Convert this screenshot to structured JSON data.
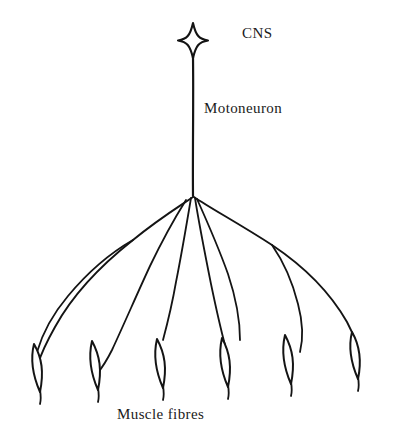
{
  "figure": {
    "background_color": "#ffffff",
    "ink_color": "#141414"
  },
  "labels": {
    "cns": "CNS",
    "motoneuron": "Motoneuron",
    "muscle_fibres": "Muscle fibres"
  },
  "structures": {
    "soma": {
      "name": "Cell body (star shaped)",
      "center_x": 193,
      "center_y": 40
    },
    "axon": {
      "name": "Axon",
      "top_y": 58,
      "branch_point_x": 193,
      "branch_point_y": 196
    },
    "branch_nodes": [
      {
        "name": "left-secondary-node",
        "x": 133,
        "y": 240
      },
      {
        "name": "right-secondary-node",
        "x": 272,
        "y": 245
      }
    ],
    "muscle_fibre_count": 6,
    "muscle_fibres": [
      {
        "index": 1,
        "x": 37,
        "y": 370
      },
      {
        "index": 2,
        "x": 95,
        "y": 368
      },
      {
        "index": 3,
        "x": 160,
        "y": 365
      },
      {
        "index": 4,
        "x": 225,
        "y": 365
      },
      {
        "index": 5,
        "x": 288,
        "y": 362
      },
      {
        "index": 6,
        "x": 355,
        "y": 358
      }
    ]
  }
}
